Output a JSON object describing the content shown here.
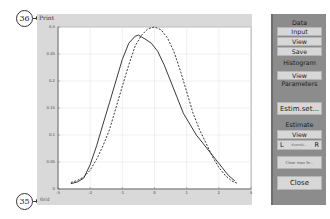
{
  "callouts": {
    "top": "36",
    "bottom": "35"
  },
  "figure": {
    "print_label": "Print",
    "grid_label": "Grid"
  },
  "panel": {
    "data_heading": "Data",
    "input_button": "Input",
    "view_button": "View",
    "save_button": "Save",
    "histogram_heading": "Histogram",
    "histogram_view_button": "View",
    "parameters_label": "Parameters",
    "estim_set_button": "Estim.set...",
    "estimate_heading": "Estimate",
    "estimate_view_button": "View",
    "left_button": "L",
    "kernel_label": "Kcomb...",
    "right_button": "R",
    "clear_button": "Clear max fe...",
    "close_button": "Close"
  },
  "chart_data": {
    "type": "line",
    "title": "",
    "xlabel": "",
    "ylabel": "",
    "xlim": [
      -3,
      3
    ],
    "ylim": [
      0,
      0.3
    ],
    "grid": true,
    "x_ticks": [
      "-3",
      "-2",
      "-1",
      "0",
      "1",
      "2",
      "3"
    ],
    "y_ticks": [
      "0",
      "0.05",
      "0.1",
      "0.15",
      "0.2",
      "0.25",
      "0.3"
    ],
    "series": [
      {
        "name": "estimate (solid)",
        "style": "solid",
        "x": [
          -2.6,
          -2.4,
          -2.2,
          -2.0,
          -1.8,
          -1.6,
          -1.4,
          -1.2,
          -1.0,
          -0.8,
          -0.6,
          -0.5,
          -0.3,
          -0.1,
          0.1,
          0.3,
          0.5,
          0.7,
          0.9,
          1.1,
          1.3,
          1.5,
          1.7,
          1.9,
          2.1,
          2.3,
          2.5
        ],
        "y": [
          0.01,
          0.013,
          0.02,
          0.045,
          0.08,
          0.12,
          0.16,
          0.2,
          0.24,
          0.27,
          0.283,
          0.285,
          0.278,
          0.27,
          0.255,
          0.23,
          0.2,
          0.17,
          0.14,
          0.12,
          0.1,
          0.085,
          0.07,
          0.055,
          0.04,
          0.025,
          0.015
        ]
      },
      {
        "name": "normal (dashed)",
        "style": "dashed",
        "x": [
          -2.6,
          -2.4,
          -2.2,
          -2.0,
          -1.8,
          -1.6,
          -1.4,
          -1.2,
          -1.0,
          -0.8,
          -0.6,
          -0.4,
          -0.2,
          0.0,
          0.2,
          0.4,
          0.6,
          0.8,
          1.0,
          1.2,
          1.4,
          1.6,
          1.8,
          2.0,
          2.2,
          2.4,
          2.6
        ],
        "y": [
          0.012,
          0.016,
          0.022,
          0.035,
          0.055,
          0.08,
          0.11,
          0.15,
          0.19,
          0.23,
          0.265,
          0.285,
          0.297,
          0.3,
          0.295,
          0.28,
          0.255,
          0.22,
          0.18,
          0.14,
          0.11,
          0.085,
          0.06,
          0.04,
          0.025,
          0.015,
          0.01
        ]
      }
    ]
  }
}
